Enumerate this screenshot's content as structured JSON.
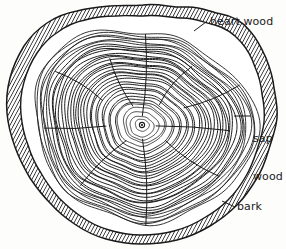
{
  "illustration": {
    "subject": "tree-trunk-cross-section",
    "background_color": "#fdfdfc",
    "ink_color": "#1a1a1a"
  },
  "labels": {
    "heart_wood": "heart wood",
    "sap_wood_line1": "sap",
    "sap_wood_line2": "wood",
    "bark": "bark"
  },
  "chart_data": {
    "type": "diagram",
    "title": "",
    "annotations": [
      "heart wood",
      "sap wood",
      "bark"
    ],
    "parts": [
      {
        "name": "bark",
        "description": "hatched outer band"
      },
      {
        "name": "sap wood",
        "description": "pale outer ring zone"
      },
      {
        "name": "heart wood",
        "description": "dense inner growth rings"
      }
    ],
    "growth_ring_count": 35
  }
}
